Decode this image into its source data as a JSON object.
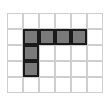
{
  "grid": {
    "rows": 5,
    "cols": 6,
    "shaded_color": "#7a7a7a",
    "shaded_cells": [
      [
        1,
        1
      ],
      [
        1,
        2
      ],
      [
        1,
        3
      ],
      [
        1,
        4
      ],
      [
        2,
        1
      ],
      [
        3,
        1
      ]
    ]
  }
}
